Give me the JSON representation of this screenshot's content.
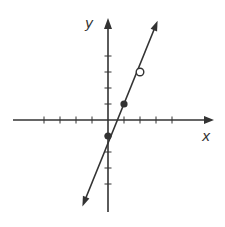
{
  "chart_data": {
    "type": "line",
    "title": "",
    "xlabel": "x",
    "ylabel": "y",
    "xlim": [
      -6,
      6.5
    ],
    "ylim": [
      -5.8,
      6.3
    ],
    "grid": false,
    "x_ticks": [
      -4,
      -3,
      -2,
      -1,
      1,
      2,
      3,
      4
    ],
    "y_ticks": [
      -4,
      -3,
      -2,
      -1,
      1,
      2,
      3,
      4
    ],
    "tick_labels_shown": false,
    "series": [
      {
        "name": "line",
        "equation": "y = 2x - 1",
        "slope": 2,
        "intercept": -1,
        "x": [
          -1.6,
          3.1
        ],
        "y": [
          -5.4,
          6.2
        ],
        "arrows_both_ends": true
      }
    ],
    "points": [
      {
        "x": 0,
        "y": -1,
        "style": "closed"
      },
      {
        "x": 1,
        "y": 1,
        "style": "closed"
      },
      {
        "x": 2,
        "y": 3,
        "style": "open"
      }
    ]
  },
  "labels": {
    "x_axis": "x",
    "y_axis": "y"
  },
  "colors": {
    "line": "#333333",
    "axis": "#333333",
    "open_fill": "#ffffff"
  }
}
